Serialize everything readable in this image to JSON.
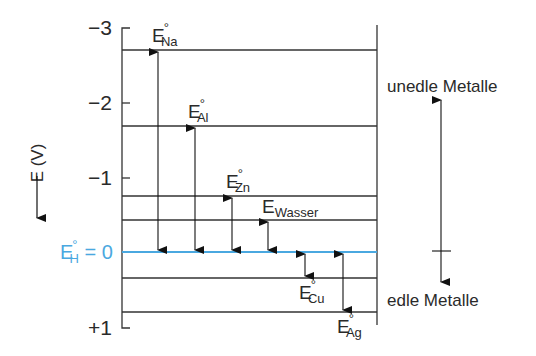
{
  "diagram": {
    "axis_label": "E (V)",
    "ticks": [
      {
        "label": "−3",
        "value": -3
      },
      {
        "label": "−2",
        "value": -2
      },
      {
        "label": "−1",
        "value": -1
      },
      {
        "label": "+1",
        "value": 1
      }
    ],
    "reference": {
      "symbol": "E",
      "sup": "°",
      "sub": "H",
      "rest": " = 0",
      "color": "#4aa8e0"
    },
    "levels": [
      {
        "name": "Na",
        "sub": "Na",
        "value": -2.71
      },
      {
        "name": "Al",
        "sub": "Al",
        "value": -1.66
      },
      {
        "name": "Zn",
        "sub": "Zn",
        "value": -0.76
      },
      {
        "name": "Wasser",
        "sub": "Wasser",
        "value": -0.41
      },
      {
        "name": "Cu",
        "sub": "Cu",
        "value": 0.35
      },
      {
        "name": "Ag",
        "sub": "Ag",
        "value": 0.8
      }
    ],
    "side_labels": {
      "top": "unedle Metalle",
      "bottom": "edle Metalle"
    },
    "symbol": "E",
    "degree": "°"
  }
}
